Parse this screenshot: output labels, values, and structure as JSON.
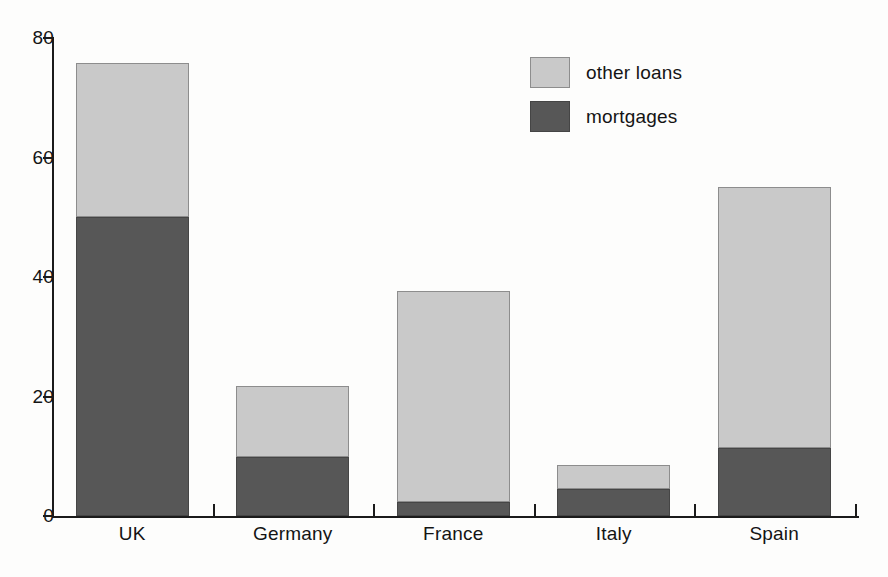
{
  "chart_data": {
    "type": "bar",
    "stacked": true,
    "title": "",
    "subtitle": "",
    "xlabel": "",
    "ylabel": "",
    "categories": [
      "UK",
      "Germany",
      "France",
      "Italy",
      "Spain"
    ],
    "series": [
      {
        "name": "mortgages",
        "values": [
          50.0,
          9.8,
          2.3,
          4.5,
          11.3
        ]
      },
      {
        "name": "other loans",
        "values": [
          25.8,
          12.0,
          35.3,
          4.0,
          43.8
        ]
      }
    ],
    "totals": [
      75.8,
      21.8,
      37.6,
      8.5,
      55.1
    ],
    "ylim": [
      0,
      80
    ],
    "yticks": [
      0,
      20,
      40,
      60,
      80
    ],
    "ytick_labels": [
      "0",
      "20",
      "40",
      "60",
      "80"
    ],
    "grid": false,
    "legend": {
      "position": "top-right",
      "entries": [
        {
          "label": "other loans",
          "color": "#c9c9c9"
        },
        {
          "label": "mortgages",
          "color": "#575757"
        }
      ]
    },
    "colors": {
      "other_loans": "#c9c9c9",
      "mortgages": "#575757",
      "axis": "#1b1b1b",
      "background": "#fdfdfc",
      "text": "#141414"
    }
  }
}
